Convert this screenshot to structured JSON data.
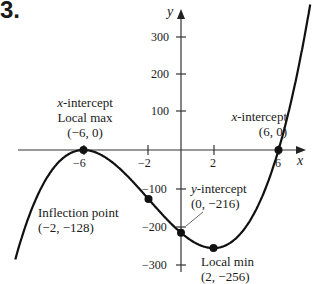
{
  "problem_number": "3.",
  "chart_data": {
    "type": "line",
    "title": "",
    "function": "f(x) = (x + 6)^2 (x - 6)",
    "xlabel": "x",
    "ylabel": "y",
    "xlim": [
      -11,
      9
    ],
    "ylim": [
      -320,
      400
    ],
    "grid": false,
    "x_ticks": [
      -6,
      -2,
      2,
      6
    ],
    "x_tick_labels": [
      "−6",
      "−2",
      "2",
      "6"
    ],
    "y_ticks": [
      300,
      200,
      100,
      -100,
      -200,
      -300
    ],
    "y_tick_labels": [
      "300",
      "200",
      "100",
      "−100",
      "−200",
      "−300"
    ],
    "x": [
      -10.2,
      -9,
      -8,
      -7,
      -6,
      -5,
      -4,
      -3,
      -2,
      -1,
      0,
      1,
      2,
      3,
      4,
      5,
      6,
      7,
      8
    ],
    "y": [
      -285,
      -135,
      -56,
      -13,
      0,
      -11,
      -40,
      -81,
      -128,
      -175,
      -216,
      -245,
      -256,
      -243,
      -200,
      -121,
      0,
      169,
      392
    ],
    "points": [
      {
        "x": -6,
        "y": 0,
        "label": [
          "x-intercept",
          "Local max",
          "(−6, 0)"
        ]
      },
      {
        "x": 6,
        "y": 0,
        "label": [
          "x-intercept",
          "(6, 0)"
        ]
      },
      {
        "x": -2,
        "y": -128,
        "label": [
          "Inflection point",
          "(−2, −128)"
        ]
      },
      {
        "x": 0,
        "y": -216,
        "label": [
          "y-intercept",
          "(0, −216)"
        ]
      },
      {
        "x": 2,
        "y": -256,
        "label": [
          "Local min",
          "(2, −256)"
        ]
      }
    ]
  },
  "labels": {
    "max_l1": "x",
    "max_l1b": "-intercept",
    "max_l2": "Local max",
    "max_l3": "(−6, 0)",
    "xint_l1": "x",
    "xint_l1b": "-intercept",
    "xint_l2": "(6, 0)",
    "infl_l1": "Inflection point",
    "infl_l2": "(−2, −128)",
    "yint_l1": "y",
    "yint_l1b": "-intercept",
    "yint_l2": "(0, −216)",
    "min_l1": "Local min",
    "min_l2": "(2, −256)",
    "axis_x": "x",
    "axis_y": "y"
  }
}
